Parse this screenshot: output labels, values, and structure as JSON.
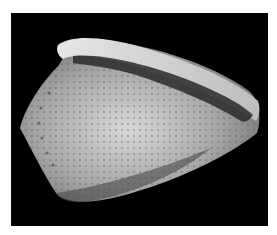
{
  "image": {
    "subject": "cone shell",
    "background": "#000000",
    "page_background": "#ffffff"
  }
}
